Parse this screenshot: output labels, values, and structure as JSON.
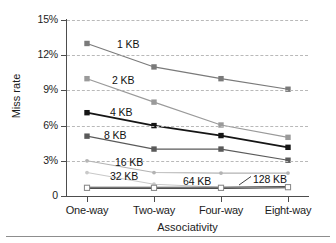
{
  "chart_data": {
    "type": "line",
    "title": "",
    "xlabel": "Associativity",
    "ylabel": "Miss rate",
    "categories": [
      "One-way",
      "Two-way",
      "Four-way",
      "Eight-way"
    ],
    "ytick_labels": [
      "0",
      "3%",
      "6%",
      "9%",
      "12%",
      "15%"
    ],
    "ytick_values": [
      0,
      3,
      6,
      9,
      12,
      15
    ],
    "ylim": [
      0,
      15
    ],
    "grid": "horizontal-dashed",
    "legend": "inline-labels",
    "series": [
      {
        "name": "1 KB",
        "values": [
          13.0,
          11.0,
          10.0,
          9.1
        ],
        "color": "#7a7a7a",
        "marker": "square-filled"
      },
      {
        "name": "2 KB",
        "values": [
          10.0,
          8.0,
          6.05,
          5.0
        ],
        "color": "#9a9a9a",
        "marker": "square-filled"
      },
      {
        "name": "4 KB",
        "values": [
          7.1,
          6.0,
          5.15,
          4.15
        ],
        "color": "#151515",
        "marker": "square-filled"
      },
      {
        "name": "8 KB",
        "values": [
          5.1,
          4.0,
          4.0,
          3.05
        ],
        "color": "#5a5a5a",
        "marker": "square-filled"
      },
      {
        "name": "16 KB",
        "values": [
          3.0,
          2.0,
          1.95,
          1.95
        ],
        "color": "#b3b3b3",
        "marker": "dot"
      },
      {
        "name": "32 KB",
        "values": [
          2.0,
          1.0,
          0.75,
          0.75
        ],
        "color": "#c9c9c9",
        "marker": "dot"
      },
      {
        "name": "64 KB",
        "values": [
          0.7,
          0.7,
          0.7,
          0.75
        ],
        "color": "#3a3a3a",
        "marker": "square-filled"
      },
      {
        "name": "128 KB",
        "values": [
          0.7,
          0.7,
          0.7,
          0.75
        ],
        "color": "#8a8a8a",
        "marker": "square-open"
      }
    ],
    "annotations": [
      {
        "text": "1 KB",
        "x": 117,
        "y": 38
      },
      {
        "text": "2 KB",
        "x": 112,
        "y": 74
      },
      {
        "text": "4 KB",
        "x": 110,
        "y": 106
      },
      {
        "text": "8 KB",
        "x": 104,
        "y": 129
      },
      {
        "text": "16 KB",
        "x": 115,
        "y": 156
      },
      {
        "text": "32 KB",
        "x": 110,
        "y": 170
      },
      {
        "text": "64 KB",
        "x": 183,
        "y": 175
      },
      {
        "text": "128 KB",
        "x": 253,
        "y": 173
      }
    ]
  }
}
